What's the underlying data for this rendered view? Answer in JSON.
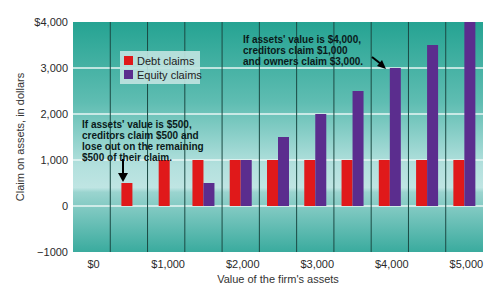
{
  "chart_data": {
    "type": "bar",
    "title": "",
    "xlabel": "Value of the firm's assets",
    "ylabel": "Claim on assets, in dollars",
    "ylim": [
      -1000,
      4000
    ],
    "yticks": [
      "$4,000",
      "3,000",
      "2,000",
      "1,000",
      "0",
      "−1000"
    ],
    "ytick_values": [
      4000,
      3000,
      2000,
      1000,
      0,
      -1000
    ],
    "xticks": [
      "$0",
      "$1,000",
      "$2,000",
      "$3,000",
      "$4,000",
      "$5,000"
    ],
    "xtick_values": [
      0,
      1000,
      2000,
      3000,
      4000,
      5000
    ],
    "categories": [
      500,
      1000,
      1500,
      2000,
      2500,
      3000,
      3500,
      4000,
      4500,
      5000
    ],
    "series": [
      {
        "name": "Debt claims",
        "color": "#e0191a",
        "values": [
          500,
          1000,
          1000,
          1000,
          1000,
          1000,
          1000,
          1000,
          1000,
          1000
        ]
      },
      {
        "name": "Equity claims",
        "color": "#5b2d8e",
        "values": [
          0,
          0,
          500,
          1000,
          1500,
          2000,
          2500,
          3000,
          3500,
          4000
        ]
      }
    ],
    "grid": true,
    "legend_position": "upper-left-inside",
    "annotations": [
      {
        "lines": [
          "If assets' value is $500,",
          "creditors claim $500 and",
          "lose out on the remaining",
          "$500 of their claim."
        ],
        "points_to": 500
      },
      {
        "lines": [
          "If assets' value is $4,000,",
          "creditors claim $1,000",
          "and owners claim $3,000."
        ],
        "points_to": 4000
      }
    ]
  },
  "colors": {
    "plot_top": "#2aa696",
    "plot_mid": "#a6d9d6",
    "plot_bottom": "#47b0a5",
    "gridline": "#1b4a44",
    "debt": "#e0191a",
    "equity": "#5b2d8e"
  }
}
